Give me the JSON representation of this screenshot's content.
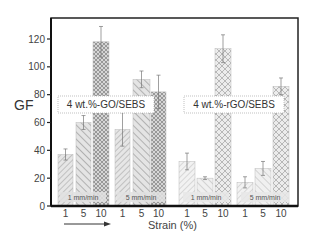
{
  "chart_data": {
    "type": "bar",
    "title": "",
    "xlabel": "Strain (%)",
    "ylabel": "GF",
    "ylim": [
      0,
      130
    ],
    "yticks": [
      0,
      20,
      40,
      60,
      80,
      100,
      120
    ],
    "grid": false,
    "legend": null,
    "annotations": [
      "4 wt.%-GO/SEBS",
      "4 wt.%-rGO/SEBS",
      "1 mm/min",
      "5 mm/min",
      "1 mm/min",
      "5 mm/min"
    ],
    "categories": [
      "1",
      "5",
      "10"
    ],
    "groups": [
      {
        "material": "4 wt.%-GO/SEBS",
        "speed": "1 mm/min",
        "strains": [
          "1",
          "5",
          "10"
        ],
        "values": [
          37,
          60,
          118
        ],
        "errors": [
          4,
          5,
          11
        ]
      },
      {
        "material": "4 wt.%-GO/SEBS",
        "speed": "5 mm/min",
        "strains": [
          "1",
          "5",
          "10"
        ],
        "values": [
          55,
          91,
          82
        ],
        "errors": [
          12,
          6,
          12
        ]
      },
      {
        "material": "4 wt.%-rGO/SEBS",
        "speed": "1 mm/min",
        "strains": [
          "1",
          "5",
          "10"
        ],
        "values": [
          32,
          20,
          113
        ],
        "errors": [
          6,
          1,
          10
        ]
      },
      {
        "material": "4 wt.%-rGO/SEBS",
        "speed": "5 mm/min",
        "strains": [
          "1",
          "5",
          "10"
        ],
        "values": [
          17,
          27,
          86
        ],
        "errors": [
          4,
          5,
          6
        ]
      }
    ]
  },
  "labels": {
    "ylabel": "GF",
    "xlabel": "Strain (%)",
    "go_label": "4 wt.%-GO/SEBS",
    "rgo_label": "4 wt.%-rGO/SEBS",
    "speed_1": "1 mm/min",
    "speed_5": "5 mm/min"
  }
}
